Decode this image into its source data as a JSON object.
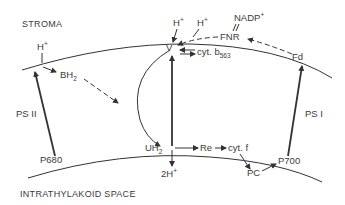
{
  "regions": {
    "top": "STROMA",
    "bottom": "INTRATHYLAKOID SPACE"
  },
  "photosystems": {
    "ps2": "PS II",
    "ps1": "PS I",
    "p680": "P680",
    "p700": "P700"
  },
  "carriers": {
    "h_plus_left": "H+",
    "bh2": "BH2",
    "v": "V",
    "h_plus_top1": "H+",
    "h_plus_top2": "H+",
    "nadp": "NADP+",
    "fnr": "FNR",
    "fd": "Fd",
    "cyt_b": "cyt. b",
    "cyt_b_sub": "563",
    "uh2": "UH2",
    "re": "Re",
    "cyt_f": "cyt. f",
    "pc": "PC",
    "two_h_plus": "2H+"
  }
}
